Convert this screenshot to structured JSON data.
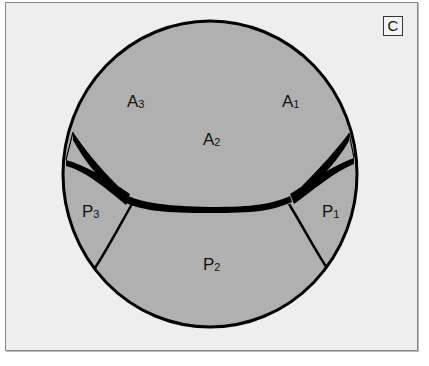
{
  "figure": {
    "panel_label": "C",
    "colors": {
      "background": "#eeeeee",
      "circle_fill": "#b0b0b0",
      "lines": "#000000"
    },
    "regions": [
      {
        "id": "A3",
        "base": "A",
        "sub": "3"
      },
      {
        "id": "A1",
        "base": "A",
        "sub": "1"
      },
      {
        "id": "A2",
        "base": "A",
        "sub": "2"
      },
      {
        "id": "P3",
        "base": "P",
        "sub": "3"
      },
      {
        "id": "P1",
        "base": "P",
        "sub": "1"
      },
      {
        "id": "P2",
        "base": "P",
        "sub": "2"
      }
    ]
  }
}
